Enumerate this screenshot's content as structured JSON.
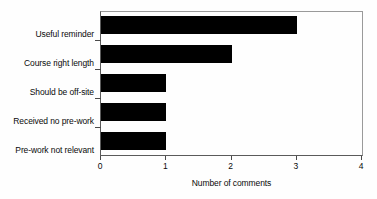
{
  "chart_data": {
    "type": "bar",
    "orientation": "horizontal",
    "title": "",
    "xlabel": "Number of comments",
    "ylabel": "",
    "categories": [
      "Useful reminder",
      "Course right length",
      "Should be off-site",
      "Received no pre-work",
      "Pre-work not relevant"
    ],
    "values": [
      3,
      2,
      1,
      1,
      1
    ],
    "xlim": [
      0,
      4
    ],
    "xticks": [
      0,
      1,
      2,
      3,
      4
    ],
    "xtick_labels": [
      "0",
      "1",
      "2",
      "3",
      "4"
    ],
    "grid": false,
    "legend": null,
    "bar_color": "#000000",
    "axis_color": "#5a5a5a",
    "frame_color": "#9a9a9a",
    "background_color": "#fefefe"
  }
}
